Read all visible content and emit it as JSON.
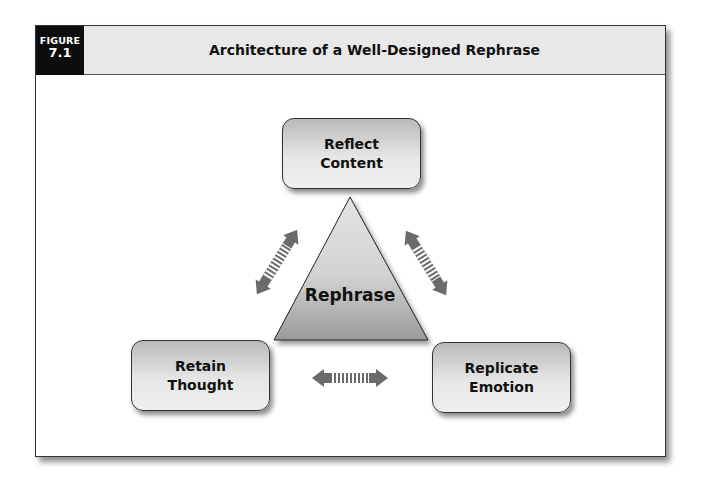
{
  "figure": {
    "label_word": "FIGURE",
    "label_number": "7.1",
    "title": "Architecture of a Well-Designed Rephrase"
  },
  "diagram": {
    "center": {
      "label": "Rephrase",
      "shape": "triangle"
    },
    "nodes": [
      {
        "id": "top",
        "line1": "Reflect",
        "line2": "Content"
      },
      {
        "id": "bottom-left",
        "line1": "Retain",
        "line2": "Thought"
      },
      {
        "id": "bottom-right",
        "line1": "Replicate",
        "line2": "Emotion"
      }
    ],
    "arrows": [
      {
        "from": "center",
        "to": "top-left-diagonal",
        "type": "double-headed-striped"
      },
      {
        "from": "center",
        "to": "top-right-diagonal",
        "type": "double-headed-striped"
      },
      {
        "from": "bottom-left",
        "to": "bottom-right",
        "type": "double-headed-striped"
      }
    ],
    "colors": {
      "header_bg": "#e8e8e8",
      "label_bg": "#0d0d0d",
      "arrow": "#6b6b6b",
      "box_top": "#b9b9b9",
      "box_bottom": "#efefef"
    }
  }
}
